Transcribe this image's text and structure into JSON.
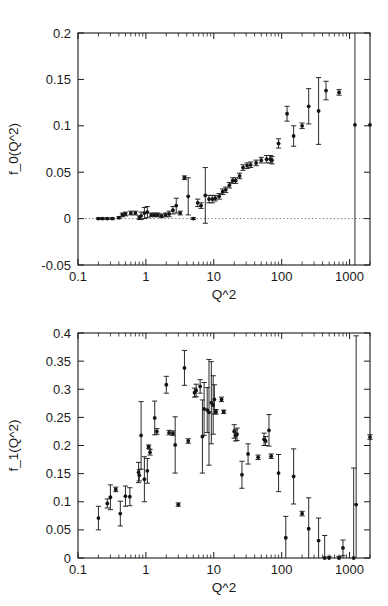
{
  "figure": {
    "background": "#ffffff",
    "marker_color": "#141414",
    "axis_color": "#1b1b1b",
    "panels": [
      "top",
      "bottom"
    ]
  },
  "chart_data": [
    {
      "type": "scatter",
      "panel": "top",
      "title": "",
      "xlabel": "Q^2",
      "ylabel": "f_0(Q^2)",
      "xscale": "log",
      "yscale": "linear",
      "xlim": [
        0.1,
        2000
      ],
      "ylim": [
        -0.05,
        0.2
      ],
      "xticks": [
        0.1,
        1,
        10,
        100,
        1000
      ],
      "xticklabels": [
        "0.1",
        "1",
        "10",
        "100",
        "1000"
      ],
      "yticks": [
        -0.05,
        0,
        0.05,
        0.1,
        0.15,
        0.2
      ],
      "yticklabels": [
        "-0.05",
        "0",
        "0.05",
        "0.1",
        "0.15",
        "0.2"
      ],
      "grid": false,
      "legend": null,
      "zero_line": 0,
      "errorbars": "y",
      "x": [
        0.2,
        0.23,
        0.27,
        0.32,
        0.4,
        0.45,
        0.5,
        0.6,
        0.7,
        0.8,
        0.85,
        0.95,
        1.05,
        1.2,
        1.35,
        1.5,
        1.7,
        1.95,
        2.2,
        2.5,
        2.8,
        3.2,
        3.7,
        4.2,
        5.0,
        5.8,
        6.5,
        7.5,
        8.5,
        9.5,
        10.5,
        12.0,
        13.5,
        15.0,
        17.0,
        19.0,
        21.0,
        24.0,
        27.0,
        31.0,
        35.0,
        42.0,
        50.0,
        60.0,
        68.0,
        72.0,
        90.0,
        120.0,
        150.0,
        200.0,
        250.0,
        350.0,
        450.0,
        700.0,
        1200.0,
        2000.0
      ],
      "y": [
        0.0,
        0.0,
        0.0,
        0.0,
        0.001,
        0.004,
        0.005,
        0.006,
        0.006,
        0.001,
        0.003,
        0.006,
        0.007,
        0.004,
        0.004,
        0.004,
        0.003,
        0.004,
        0.005,
        0.009,
        0.014,
        0.006,
        0.044,
        0.024,
        0.0,
        0.017,
        0.014,
        0.025,
        0.021,
        0.021,
        0.022,
        0.024,
        0.029,
        0.031,
        0.036,
        0.041,
        0.041,
        0.046,
        0.055,
        0.057,
        0.058,
        0.06,
        0.063,
        0.064,
        0.064,
        0.063,
        0.081,
        0.113,
        0.089,
        0.1,
        0.121,
        0.116,
        0.138,
        0.136,
        0.101,
        0.101
      ],
      "yerr": [
        0.0008,
        0.0008,
        0.0008,
        0.0009,
        0.001,
        0.002,
        0.002,
        0.002,
        0.002,
        0.002,
        0.004,
        0.006,
        0.006,
        0.002,
        0.002,
        0.002,
        0.002,
        0.002,
        0.003,
        0.004,
        0.008,
        0.002,
        0.002,
        0.02,
        0.001,
        0.004,
        0.003,
        0.03,
        0.004,
        0.004,
        0.003,
        0.003,
        0.003,
        0.003,
        0.003,
        0.003,
        0.003,
        0.003,
        0.003,
        0.003,
        0.003,
        0.003,
        0.003,
        0.004,
        0.004,
        0.004,
        0.005,
        0.008,
        0.011,
        0.003,
        0.019,
        0.036,
        0.01,
        0.003,
        0.2,
        0.0
      ]
    },
    {
      "type": "scatter",
      "panel": "bottom",
      "title": "",
      "xlabel": "Q^2",
      "ylabel": "f_1(Q^2)",
      "xscale": "log",
      "yscale": "linear",
      "xlim": [
        0.1,
        2000
      ],
      "ylim": [
        0,
        0.4
      ],
      "xticks": [
        0.1,
        1,
        10,
        100,
        1000
      ],
      "xticklabels": [
        "0.1",
        "1",
        "10",
        "100",
        "1000"
      ],
      "yticks": [
        0,
        0.05,
        0.1,
        0.15,
        0.2,
        0.25,
        0.3,
        0.35,
        0.4
      ],
      "yticklabels": [
        "0",
        "0.05",
        "0.1",
        "0.15",
        "0.2",
        "0.25",
        "0.3",
        "0.35",
        "0.4"
      ],
      "grid": false,
      "legend": null,
      "errorbars": "y",
      "x": [
        0.2,
        0.27,
        0.3,
        0.36,
        0.42,
        0.5,
        0.58,
        0.78,
        0.8,
        0.85,
        0.95,
        1.05,
        1.1,
        1.15,
        1.35,
        1.45,
        2.0,
        2.2,
        2.5,
        2.7,
        3.0,
        3.7,
        4.2,
        5.2,
        5.5,
        6.3,
        6.8,
        7.2,
        8.0,
        8.5,
        9.2,
        9.8,
        10.2,
        10.8,
        13.0,
        14.0,
        20.0,
        21.0,
        22.0,
        26.0,
        32.0,
        45.0,
        55.0,
        58.0,
        65.0,
        70.0,
        90.0,
        115.0,
        150.0,
        200.0,
        250.0,
        350.0,
        430.0,
        500.0,
        700.0,
        800.0,
        1150.0,
        1250.0,
        2000.0
      ],
      "y": [
        0.071,
        0.097,
        0.108,
        0.122,
        0.079,
        0.11,
        0.109,
        0.152,
        0.147,
        0.218,
        0.14,
        0.155,
        0.198,
        0.188,
        0.249,
        0.225,
        0.308,
        0.223,
        0.222,
        0.201,
        0.095,
        0.338,
        0.208,
        0.294,
        0.298,
        0.305,
        0.216,
        0.265,
        0.263,
        0.259,
        0.276,
        0.272,
        0.282,
        0.26,
        0.282,
        0.26,
        0.225,
        0.218,
        0.22,
        0.148,
        0.185,
        0.179,
        0.211,
        0.208,
        0.227,
        0.181,
        0.151,
        0.036,
        0.145,
        0.079,
        0.052,
        0.031,
        0.0,
        0.0,
        0.0,
        0.018,
        0.0,
        0.095,
        0.215
      ],
      "yerr": [
        0.021,
        0.008,
        0.022,
        0.004,
        0.022,
        0.018,
        0.016,
        0.018,
        0.01,
        0.06,
        0.04,
        0.022,
        0.003,
        0.005,
        0.03,
        0.005,
        0.015,
        0.004,
        0.004,
        0.05,
        0.003,
        0.031,
        0.004,
        0.008,
        0.011,
        0.012,
        0.065,
        0.047,
        0.04,
        0.094,
        0.073,
        0.052,
        0.026,
        0.004,
        0.004,
        0.003,
        0.012,
        0.01,
        0.011,
        0.024,
        0.018,
        0.004,
        0.011,
        0.008,
        0.028,
        0.004,
        0.033,
        0.038,
        0.049,
        0.004,
        0.055,
        0.04,
        0.04,
        0.003,
        0.003,
        0.014,
        0.16,
        0.3,
        0.004
      ]
    }
  ]
}
